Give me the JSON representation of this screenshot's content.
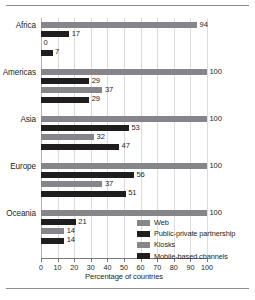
{
  "chart_data": {
    "type": "bar",
    "orientation": "horizontal",
    "title": "",
    "xlabel": "Percentage of countries",
    "ylabel": "",
    "xlim": [
      0,
      100
    ],
    "xticks": [
      0,
      10,
      20,
      30,
      40,
      50,
      60,
      70,
      80,
      90,
      100
    ],
    "grid": "vertical",
    "legend_position": "inside-lower-right",
    "categories": [
      "Africa",
      "Americas",
      "Asia",
      "Europe",
      "Oceania"
    ],
    "series": [
      {
        "name": "Web",
        "color": "#86868a",
        "values": [
          94,
          100,
          100,
          100,
          100
        ]
      },
      {
        "name": "Public-private partnership",
        "color": "#201d1e",
        "values": [
          17,
          29,
          53,
          56,
          21
        ]
      },
      {
        "name": "Kiosks",
        "color": "#86868a",
        "values": [
          0,
          37,
          32,
          37,
          14
        ]
      },
      {
        "name": "Mobile-based channels",
        "color": "#201d1e",
        "values": [
          7,
          29,
          47,
          51,
          14
        ]
      }
    ]
  }
}
